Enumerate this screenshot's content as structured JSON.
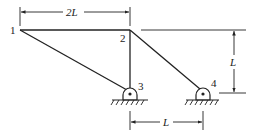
{
  "diagram": {
    "type": "truss",
    "nodes": [
      {
        "id": "1",
        "label": "1",
        "x": 20,
        "y": 30
      },
      {
        "id": "2",
        "label": "2",
        "x": 130,
        "y": 30
      },
      {
        "id": "3",
        "label": "3",
        "x": 130,
        "y": 92,
        "support": "pin"
      },
      {
        "id": "4",
        "label": "4",
        "x": 203,
        "y": 92,
        "support": "pin"
      }
    ],
    "members": [
      {
        "from": "1",
        "to": "2"
      },
      {
        "from": "1",
        "to": "3"
      },
      {
        "from": "2",
        "to": "3"
      },
      {
        "from": "2",
        "to": "4"
      }
    ],
    "dimensions": {
      "top": {
        "label": "2L",
        "between": [
          "1",
          "2"
        ]
      },
      "right": {
        "label": "L",
        "description": "height from supports to top chord"
      },
      "bottom": {
        "label": "L",
        "between": [
          "3",
          "4"
        ]
      }
    },
    "colors": {
      "line": "#222222",
      "background": "#ffffff"
    }
  }
}
